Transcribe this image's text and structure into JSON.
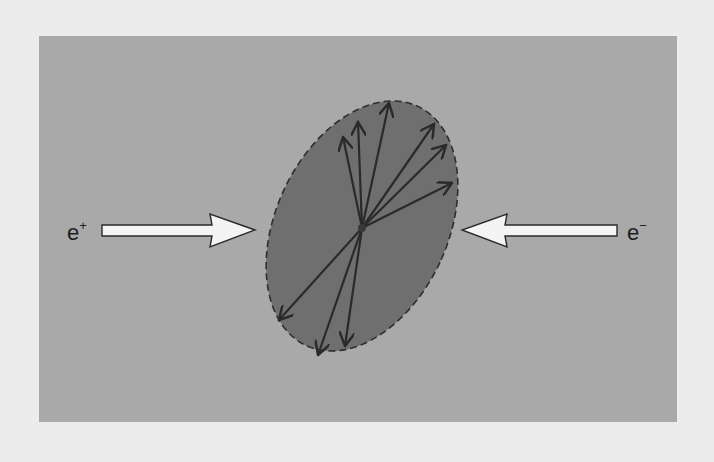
{
  "figure": {
    "colors": {
      "page_background": "#ececec",
      "panel_background": "#a9a9a9",
      "ellipse_fill": "#6f6f6f",
      "track_color": "#2a2a2a",
      "beam_arrow_fill": "#f4f4f4",
      "beam_arrow_stroke": "#2a2a2a"
    },
    "left_beam": {
      "particle": "e",
      "charge": "+",
      "direction": "right"
    },
    "right_beam": {
      "particle": "e",
      "charge": "−",
      "direction": "left"
    },
    "vertex": {
      "x": 362,
      "y": 228
    },
    "ellipse": {
      "cx": 362,
      "cy": 226,
      "rx": 88,
      "ry": 132,
      "rotation_deg": 25,
      "border": "dashed"
    },
    "tracks": [
      {
        "x2": 343,
        "y2": 137
      },
      {
        "x2": 358,
        "y2": 122
      },
      {
        "x2": 389,
        "y2": 103
      },
      {
        "x2": 434,
        "y2": 124
      },
      {
        "x2": 446,
        "y2": 145
      },
      {
        "x2": 452,
        "y2": 183
      },
      {
        "x2": 279,
        "y2": 320
      },
      {
        "x2": 318,
        "y2": 355
      },
      {
        "x2": 345,
        "y2": 346
      }
    ]
  }
}
